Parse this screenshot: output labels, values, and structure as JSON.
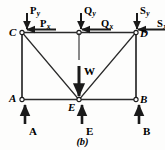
{
  "figure": {
    "caption": "(b)",
    "joints": [
      {
        "name": "C",
        "label": "C"
      },
      {
        "name": "D",
        "label": "D"
      },
      {
        "name": "A",
        "label": "A"
      },
      {
        "name": "E",
        "label": "E"
      },
      {
        "name": "B",
        "label": "B"
      }
    ],
    "applied_loads": [
      {
        "name": "P-vertical",
        "symbol": "P",
        "subscript": "y",
        "direction": "down"
      },
      {
        "name": "P-horizontal",
        "symbol": "P",
        "subscript": "x",
        "direction": "left"
      },
      {
        "name": "Q-vertical",
        "symbol": "Q",
        "subscript": "y",
        "direction": "down"
      },
      {
        "name": "Q-horizontal",
        "symbol": "Q",
        "subscript": "x",
        "direction": "left"
      },
      {
        "name": "S-vertical",
        "symbol": "S",
        "subscript": "y",
        "direction": "down"
      },
      {
        "name": "S-horizontal",
        "symbol": "S",
        "subscript": "x",
        "direction": "left"
      }
    ],
    "weight_load": {
      "label": "W",
      "direction": "down"
    },
    "reactions": [
      {
        "name": "A",
        "label": "A",
        "direction": "up"
      },
      {
        "name": "E",
        "label": "E",
        "direction": "up"
      },
      {
        "name": "B",
        "label": "B",
        "direction": "up"
      }
    ],
    "colors": {
      "ink": "#1a1a1a",
      "background": "#fdfdfc"
    }
  }
}
